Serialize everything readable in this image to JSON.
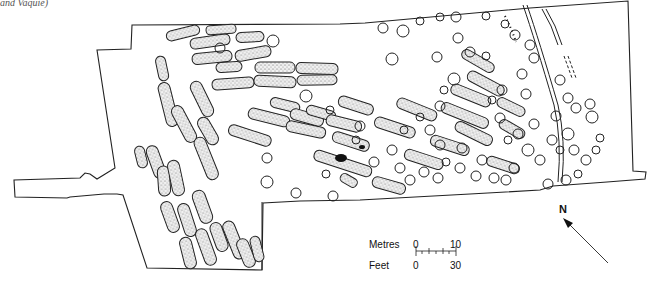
{
  "figure": {
    "caption_fragment": "and Vaquié)",
    "type": "archaeological site plan",
    "colors": {
      "outline": "#222222",
      "pit_fill": "#d9d9d9",
      "feature_dark": "#111111",
      "background": "#ffffff"
    }
  },
  "scale_bar": {
    "metres_label": "Metres",
    "metres_start": "0",
    "metres_end": "10",
    "feet_label": "Feet",
    "feet_start": "0",
    "feet_end": "30"
  },
  "north_arrow": {
    "label": "N"
  }
}
